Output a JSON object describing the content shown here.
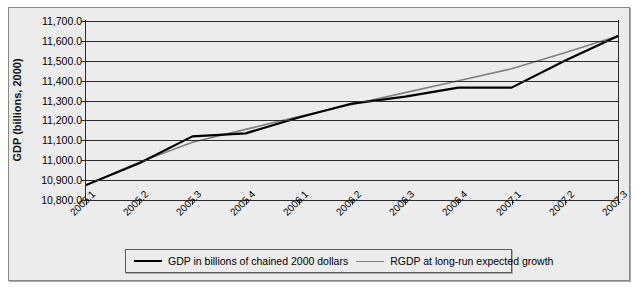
{
  "figure": {
    "top_ghost_text": "",
    "background_color": "#ececec",
    "frame_color": "#888888"
  },
  "axes": {
    "y_axis_title": "GDP (billions, 2000)",
    "y_ticks": [
      "11,700.0",
      "11,600.0",
      "11,500.0",
      "11,400.0",
      "11,300.0",
      "11,200.0",
      "11,100.0",
      "11,000.0",
      "10,900.0",
      "10,800.0"
    ],
    "y_min": 10800,
    "y_max": 11700,
    "x_ticks": [
      "2005.1",
      "2005.2",
      "2005.3",
      "2005.4",
      "2006.1",
      "2006.2",
      "2006.3",
      "2006.4",
      "2007.1",
      "2007.2",
      "2007.3"
    ]
  },
  "legend": {
    "entries": [
      {
        "label": "GDP in billions of chained 2000 dollars",
        "color": "#000000"
      },
      {
        "label": "RGDP at long-run expected growth",
        "color": "#808080"
      }
    ]
  },
  "chart_data": {
    "type": "line",
    "title": "",
    "subtitle": "",
    "xlabel": "",
    "ylabel": "GDP (billions, 2000)",
    "ylim": [
      10800,
      11700
    ],
    "grid": true,
    "legend_position": "bottom",
    "categories": [
      "2005.1",
      "2005.2",
      "2005.3",
      "2005.4",
      "2006.1",
      "2006.2",
      "2006.3",
      "2006.4",
      "2007.1",
      "2007.2",
      "2007.3"
    ],
    "series": [
      {
        "name": "GDP in billions of chained 2000 dollars",
        "color": "#000000",
        "width": 2.2,
        "values": [
          10875,
          10985,
          11120,
          11135,
          11215,
          11285,
          11320,
          11365,
          11365,
          11500,
          11625
        ]
      },
      {
        "name": "RGDP at long-run expected growth",
        "color": "#808080",
        "width": 1.6,
        "values": [
          10875,
          10990,
          11090,
          11155,
          11220,
          11280,
          11340,
          11400,
          11460,
          11540,
          11625
        ]
      }
    ]
  }
}
